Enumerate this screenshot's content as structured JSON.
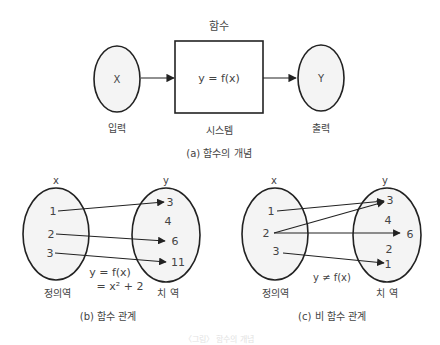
{
  "panel_a": {
    "title": "함수",
    "input_symbol": "X",
    "output_symbol": "Y",
    "system_formula": "y = f(x)",
    "input_label": "입력",
    "system_label": "시스템",
    "output_label": "출력",
    "caption": "(a)  함수의 개념"
  },
  "panel_b": {
    "domain_header": "x",
    "range_header": "y",
    "domain_values": [
      "1",
      "2",
      "3"
    ],
    "range_values": [
      "3",
      "4",
      "6",
      "11"
    ],
    "formula_line1": "y = f(x)",
    "formula_line2": "= x² + 2",
    "domain_label": "정의역",
    "range_label": "치 역",
    "caption": "(b)  함수 관계",
    "mappings": [
      [
        "1",
        "3"
      ],
      [
        "2",
        "6"
      ],
      [
        "3",
        "11"
      ]
    ]
  },
  "panel_c": {
    "domain_header": "x",
    "range_header": "y",
    "domain_values": [
      "1",
      "2",
      "3"
    ],
    "range_values": [
      "3",
      "4",
      "6",
      "2",
      "1"
    ],
    "formula": "y ≠ f(x)",
    "domain_label": "정의역",
    "range_label": "치 역",
    "caption": "(c)  비 함수 관계",
    "mappings": [
      [
        "1",
        "3"
      ],
      [
        "2",
        "3"
      ],
      [
        "2",
        "6"
      ],
      [
        "3",
        "1"
      ]
    ]
  },
  "footer_text": "〈그림〉 함수의 개념"
}
